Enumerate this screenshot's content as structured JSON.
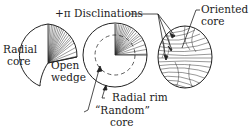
{
  "labels": {
    "disclinations": "+π Disclinations",
    "oriented_line1": "Oriented",
    "oriented_line2": "core",
    "radial_line1": "Radial",
    "radial_line2": "core",
    "open_line1": "Open",
    "open_line2": "wedge",
    "radial_rim": "Radial rim",
    "random_line1": "“Random”",
    "random_line2": "core"
  },
  "colors": {
    "stroke": "#222222",
    "background": "#ffffff"
  }
}
